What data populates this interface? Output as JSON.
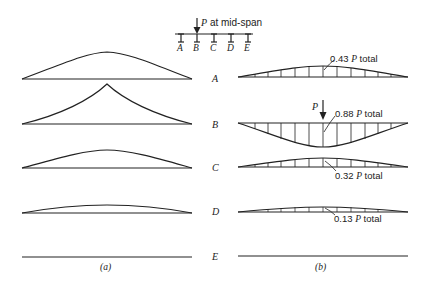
{
  "header": {
    "load_label_P": "P",
    "load_label_rest": " at mid-span",
    "beams": [
      "A",
      "B",
      "C",
      "D",
      "E"
    ]
  },
  "rows": [
    {
      "label": "A",
      "load": "0.43",
      "total": "total"
    },
    {
      "label": "B",
      "load": "0.88",
      "total": "total"
    },
    {
      "label": "C",
      "load": "0.32",
      "total": "total"
    },
    {
      "label": "D",
      "load": "0.13",
      "total": "total"
    },
    {
      "label": "E"
    }
  ],
  "panel_b_load_P": "P",
  "captions": {
    "a": "(a)",
    "b": "(b)"
  },
  "P_symbol": "P"
}
